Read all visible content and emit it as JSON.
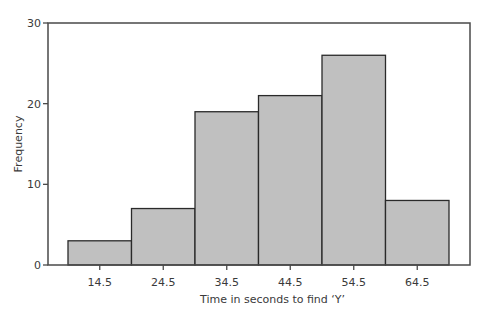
{
  "chart_data": {
    "type": "bar",
    "subtype": "histogram",
    "title": "",
    "xlabel": "Time in seconds to find ‘Y’",
    "ylabel": "Frequency",
    "categories": [
      "14.5",
      "24.5",
      "34.5",
      "44.5",
      "54.5",
      "64.5"
    ],
    "values": [
      3,
      7,
      19,
      21,
      26,
      8
    ],
    "yticks": [
      0,
      10,
      20,
      30
    ],
    "ylim": [
      0,
      30
    ],
    "grid": false,
    "legend": null,
    "bar_color": "#c0c0c0",
    "bar_edge_color": "#2a2a2a"
  }
}
